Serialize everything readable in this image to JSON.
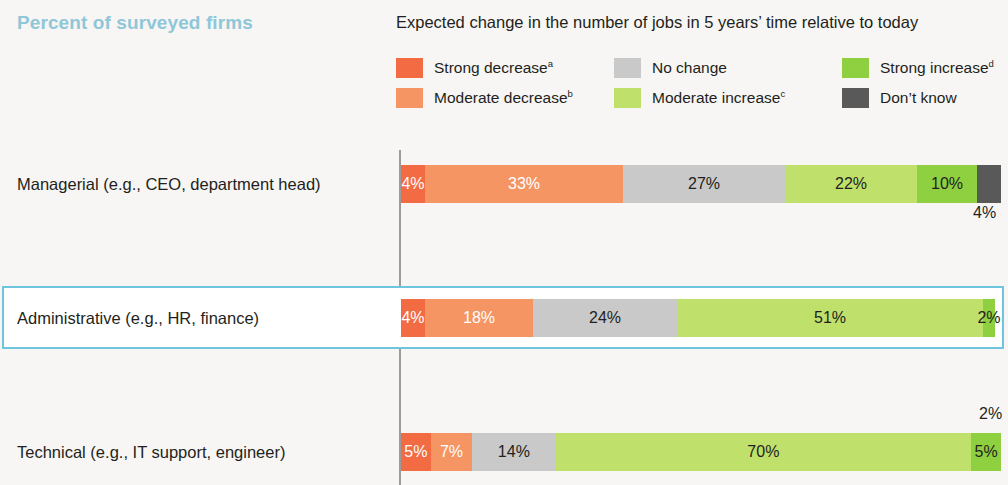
{
  "header": {
    "panel_title": "Percent of surveyed firms",
    "chart_title": "Expected change in the number of jobs in 5 years’ time relative to today"
  },
  "legend": [
    {
      "label": "Strong decrease",
      "sup": "a",
      "color": "#f26b43",
      "col": 0,
      "row": 0,
      "name": "strong-decrease"
    },
    {
      "label": "Moderate decrease",
      "sup": "b",
      "color": "#f59563",
      "col": 0,
      "row": 1,
      "name": "moderate-decrease"
    },
    {
      "label": "No change",
      "sup": "",
      "color": "#c9c9c9",
      "col": 1,
      "row": 0,
      "name": "no-change"
    },
    {
      "label": "Moderate increase",
      "sup": "c",
      "color": "#bfe06a",
      "col": 1,
      "row": 1,
      "name": "moderate-increase"
    },
    {
      "label": "Strong increase",
      "sup": "d",
      "color": "#8ed03f",
      "col": 2,
      "row": 0,
      "name": "strong-increase"
    },
    {
      "label": "Don’t know",
      "sup": "",
      "color": "#595959",
      "col": 2,
      "row": 1,
      "name": "dont-know"
    }
  ],
  "chart_data": {
    "type": "bar",
    "subtype": "stacked-horizontal-100",
    "title": "Expected change in the number of jobs in 5 years’ time relative to today",
    "panel_title": "Percent of surveyed firms",
    "xlabel": "",
    "ylabel": "",
    "xlim": [
      0,
      100
    ],
    "grid": false,
    "legend_position": "top",
    "unit": "%",
    "categories": [
      "Managerial (e.g., CEO, department head)",
      "Administrative (e.g., HR, finance)",
      "Technical (e.g., IT support, engineer)",
      "Manual jobs (e.g., factory floor worker)",
      "Customer-facing (e.g., receptionist)"
    ],
    "highlighted_category": "Technical (e.g., IT support, engineer)",
    "series": [
      {
        "name": "Strong decrease",
        "color": "#f26b43",
        "values": [
          4,
          4,
          5,
          0,
          0
        ]
      },
      {
        "name": "Moderate decrease",
        "color": "#f59563",
        "values": [
          33,
          18,
          7,
          14,
          17
        ]
      },
      {
        "name": "No change",
        "color": "#c9c9c9",
        "values": [
          27,
          24,
          14,
          29,
          39
        ]
      },
      {
        "name": "Moderate increase",
        "color": "#bfe06a",
        "values": [
          22,
          51,
          70,
          50,
          35
        ]
      },
      {
        "name": "Strong increase",
        "color": "#8ed03f",
        "values": [
          10,
          2,
          5,
          5,
          9
        ]
      },
      {
        "name": "Don’t know",
        "color": "#595959",
        "values": [
          4,
          0,
          0,
          2,
          0
        ]
      }
    ]
  },
  "rows": [
    {
      "label": "Managerial (e.g., CEO, department head)",
      "highlighted": false,
      "segments": [
        {
          "series": "Strong decrease",
          "value": 4,
          "text": "4%",
          "color": "#f26b43",
          "label_color": "light",
          "show": true
        },
        {
          "series": "Moderate decrease",
          "value": 33,
          "text": "33%",
          "color": "#f59563",
          "label_color": "light",
          "show": true
        },
        {
          "series": "No change",
          "value": 27,
          "text": "27%",
          "color": "#c9c9c9",
          "label_color": "dark",
          "show": true
        },
        {
          "series": "Moderate increase",
          "value": 22,
          "text": "22%",
          "color": "#bfe06a",
          "label_color": "dark",
          "show": true
        },
        {
          "series": "Strong increase",
          "value": 10,
          "text": "10%",
          "color": "#8ed03f",
          "label_color": "dark",
          "show": true
        },
        {
          "series": "Don’t know",
          "value": 4,
          "text": "4%",
          "color": "#595959",
          "label_color": "dark",
          "show": false
        }
      ],
      "outside_label": {
        "text": "4%",
        "series": "Don’t know"
      }
    },
    {
      "label": "Administrative (e.g., HR, finance)",
      "highlighted": false,
      "segments": [
        {
          "series": "Strong decrease",
          "value": 4,
          "text": "4%",
          "color": "#f26b43",
          "label_color": "light",
          "show": true
        },
        {
          "series": "Moderate decrease",
          "value": 18,
          "text": "18%",
          "color": "#f59563",
          "label_color": "light",
          "show": true
        },
        {
          "series": "No change",
          "value": 24,
          "text": "24%",
          "color": "#c9c9c9",
          "label_color": "dark",
          "show": true
        },
        {
          "series": "Moderate increase",
          "value": 51,
          "text": "51%",
          "color": "#bfe06a",
          "label_color": "dark",
          "show": true
        },
        {
          "series": "Strong increase",
          "value": 2,
          "text": "2%",
          "color": "#8ed03f",
          "label_color": "dark",
          "show": true
        }
      ],
      "outside_label": null
    },
    {
      "label": "Technical (e.g., IT support, engineer)",
      "highlighted": true,
      "segments": [
        {
          "series": "Strong decrease",
          "value": 5,
          "text": "5%",
          "color": "#f26b43",
          "label_color": "light",
          "show": true
        },
        {
          "series": "Moderate decrease",
          "value": 7,
          "text": "7%",
          "color": "#f59563",
          "label_color": "light",
          "show": true
        },
        {
          "series": "No change",
          "value": 14,
          "text": "14%",
          "color": "#c9c9c9",
          "label_color": "dark",
          "show": true
        },
        {
          "series": "Moderate increase",
          "value": 70,
          "text": "70%",
          "color": "#bfe06a",
          "label_color": "dark",
          "show": true
        },
        {
          "series": "Strong increase",
          "value": 5,
          "text": "5%",
          "color": "#8ed03f",
          "label_color": "dark",
          "show": true
        }
      ],
      "outside_label": null
    },
    {
      "label": "Manual jobs (e.g., factory floor worker)",
      "highlighted": false,
      "segments": [
        {
          "series": "Moderate decrease",
          "value": 14,
          "text": "14%",
          "color": "#f59563",
          "label_color": "light",
          "show": true
        },
        {
          "series": "No change",
          "value": 29,
          "text": "29%",
          "color": "#c9c9c9",
          "label_color": "dark",
          "show": true
        },
        {
          "series": "Moderate increase",
          "value": 50,
          "text": "50%",
          "color": "#bfe06a",
          "label_color": "dark",
          "show": true
        },
        {
          "series": "Strong increase",
          "value": 5,
          "text": "5%",
          "color": "#8ed03f",
          "label_color": "dark",
          "show": true
        },
        {
          "series": "Don’t know",
          "value": 2,
          "text": "2%",
          "color": "#595959",
          "label_color": "dark",
          "show": false
        }
      ],
      "outside_label": {
        "text": "2%",
        "series": "Don’t know"
      }
    },
    {
      "label": "Customer-facing (e.g., receptionist)",
      "highlighted": false,
      "segments": [
        {
          "series": "Moderate decrease",
          "value": 17,
          "text": "17%",
          "color": "#f59563",
          "label_color": "light",
          "show": true
        },
        {
          "series": "No change",
          "value": 39,
          "text": "39%",
          "color": "#c9c9c9",
          "label_color": "dark",
          "show": true
        },
        {
          "series": "Moderate increase",
          "value": 35,
          "text": "35%",
          "color": "#bfe06a",
          "label_color": "dark",
          "show": true
        },
        {
          "series": "Strong increase",
          "value": 9,
          "text": "9%",
          "color": "#8ed03f",
          "label_color": "dark",
          "show": true
        }
      ],
      "outside_label": null
    }
  ],
  "colors": {
    "background": "#f7f6f4",
    "panel_title": "#8fc7d8",
    "highlight_border": "#6fc4de",
    "axis": "#9b9b9b"
  }
}
